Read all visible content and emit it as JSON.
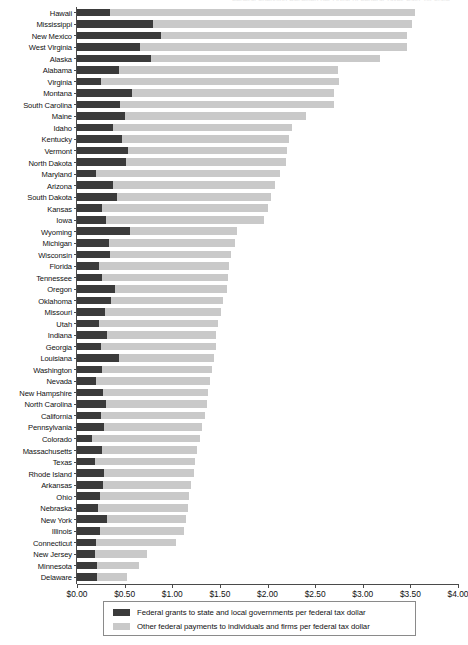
{
  "chart": {
    "title_remnant": "Federal Spending Received per Dollar of Federal Taxes Paid, by State",
    "axis": {
      "xlabel": "",
      "ylabel": "",
      "xlim": [
        0,
        4
      ],
      "tick_labels": [
        "$0.00",
        "$0.50",
        "$1.00",
        "$1.50",
        "$2.00",
        "$2.50",
        "$3.00",
        "$3.50",
        "$4.00"
      ],
      "tick_values": [
        0,
        0.5,
        1.0,
        1.5,
        2.0,
        2.5,
        3.0,
        3.5,
        4.0
      ]
    },
    "legend": {
      "position": "bottom",
      "entries": [
        {
          "swatch_name": "legend-swatch-grants",
          "color": "#3b3b3b",
          "label": "Federal grants to state and local governments per federal tax dollar"
        },
        {
          "swatch_name": "legend-swatch-other",
          "color": "#c9c9c9",
          "label": "Other federal payments to individuals and firms per federal tax dollar"
        }
      ]
    },
    "colors": {
      "grants": "#3b3b3b",
      "other": "#c9c9c9",
      "axis": "#4a4a4a",
      "background": "#ffffff"
    }
  },
  "chart_data": {
    "type": "bar",
    "orientation": "horizontal",
    "stacked": true,
    "title": "Federal Spending Received per Dollar of Federal Taxes Paid, by State",
    "xlabel": "",
    "ylabel": "",
    "xlim": [
      0,
      4
    ],
    "grid": false,
    "legend_position": "bottom",
    "categories": [
      "Hawaii",
      "Mississippi",
      "New Mexico",
      "West Virginia",
      "Alaska",
      "Alabama",
      "Virginia",
      "Montana",
      "South Carolina",
      "Maine",
      "Idaho",
      "Kentucky",
      "Vermont",
      "North Dakota",
      "Maryland",
      "Arizona",
      "South Dakota",
      "Kansas",
      "Iowa",
      "Wyoming",
      "Michigan",
      "Wisconsin",
      "Florida",
      "Tennessee",
      "Oregon",
      "Oklahoma",
      "Missouri",
      "Utah",
      "Indiana",
      "Georgia",
      "Louisiana",
      "Washington",
      "Nevada",
      "New Hampshire",
      "North Carolina",
      "California",
      "Pennsylvania",
      "Colorado",
      "Massachusetts",
      "Texas",
      "Rhode Island",
      "Arkansas",
      "Ohio",
      "Nebraska",
      "New York",
      "Illinois",
      "Connecticut",
      "New Jersey",
      "Minnesota",
      "Delaware"
    ],
    "series": [
      {
        "name": "Federal grants to state and local governments per federal tax dollar",
        "color": "#3b3b3b",
        "values": [
          0.35,
          0.8,
          0.88,
          0.66,
          0.78,
          0.44,
          0.25,
          0.58,
          0.45,
          0.5,
          0.38,
          0.47,
          0.54,
          0.51,
          0.2,
          0.38,
          0.42,
          0.26,
          0.3,
          0.56,
          0.34,
          0.35,
          0.23,
          0.26,
          0.4,
          0.36,
          0.29,
          0.23,
          0.31,
          0.25,
          0.44,
          0.26,
          0.2,
          0.27,
          0.3,
          0.25,
          0.28,
          0.16,
          0.26,
          0.19,
          0.28,
          0.27,
          0.24,
          0.22,
          0.32,
          0.24,
          0.2,
          0.19,
          0.21,
          0.21
        ]
      },
      {
        "name": "Other federal payments to individuals and firms per federal tax dollar",
        "color": "#c9c9c9",
        "values": [
          3.2,
          2.72,
          2.58,
          2.8,
          2.4,
          2.3,
          2.5,
          2.12,
          2.25,
          1.9,
          1.88,
          1.76,
          1.67,
          1.68,
          1.93,
          1.7,
          1.62,
          1.75,
          1.66,
          1.12,
          1.32,
          1.27,
          1.37,
          1.33,
          1.18,
          1.17,
          1.22,
          1.25,
          1.15,
          1.21,
          1.0,
          1.16,
          1.2,
          1.11,
          1.06,
          1.09,
          1.03,
          1.13,
          1.0,
          1.05,
          0.95,
          0.93,
          0.94,
          0.95,
          0.82,
          0.88,
          0.84,
          0.55,
          0.44,
          0.32
        ]
      }
    ],
    "totals": [
      3.55,
      3.52,
      3.46,
      3.46,
      3.18,
      2.74,
      2.75,
      2.7,
      2.7,
      2.4,
      2.26,
      2.23,
      2.21,
      2.19,
      2.13,
      2.08,
      2.04,
      2.01,
      1.96,
      1.68,
      1.66,
      1.62,
      1.6,
      1.59,
      1.58,
      1.53,
      1.51,
      1.48,
      1.46,
      1.46,
      1.44,
      1.42,
      1.4,
      1.38,
      1.36,
      1.34,
      1.31,
      1.29,
      1.26,
      1.24,
      1.23,
      1.2,
      1.18,
      1.17,
      1.14,
      1.12,
      1.04,
      0.74,
      0.65,
      0.53
    ]
  }
}
